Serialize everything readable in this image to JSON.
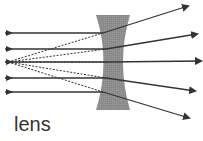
{
  "diagram": {
    "type": "diverging-lens-ray-diagram",
    "label": "lens",
    "colors": {
      "ray": "#333333",
      "lens_fill": "#8a8a8a",
      "label": "#333333"
    },
    "focal_point": {
      "x": 8,
      "y": 62
    },
    "incoming_rays": [
      {
        "y": 33,
        "x_start": 5,
        "x_hit": 103
      },
      {
        "y": 49,
        "x_start": 5,
        "x_hit": 106
      },
      {
        "y": 62,
        "x_start": 5,
        "x_hit": 107
      },
      {
        "y": 78,
        "x_start": 5,
        "x_hit": 106
      },
      {
        "y": 92,
        "x_start": 5,
        "x_hit": 103
      }
    ],
    "outgoing_rays": [
      {
        "from": [
          103,
          33
        ],
        "to": [
          188,
          6
        ]
      },
      {
        "from": [
          106,
          49
        ],
        "to": [
          197,
          34
        ]
      },
      {
        "from": [
          107,
          62
        ],
        "to": [
          201,
          61
        ]
      },
      {
        "from": [
          106,
          78
        ],
        "to": [
          195,
          91
        ]
      },
      {
        "from": [
          103,
          92
        ],
        "to": [
          189,
          118
        ]
      }
    ]
  }
}
